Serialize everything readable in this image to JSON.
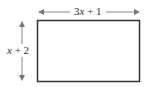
{
  "diagram": {
    "shape": "rectangle",
    "width_label": "3x + 1",
    "width_label_parts": {
      "coef": "3",
      "var": "x",
      "rest": " + 1"
    },
    "height_label": "x + 2",
    "height_label_parts": {
      "var": "x",
      "rest": " + 2"
    },
    "stroke_color": "#333333",
    "arrow_color": "#888888"
  }
}
